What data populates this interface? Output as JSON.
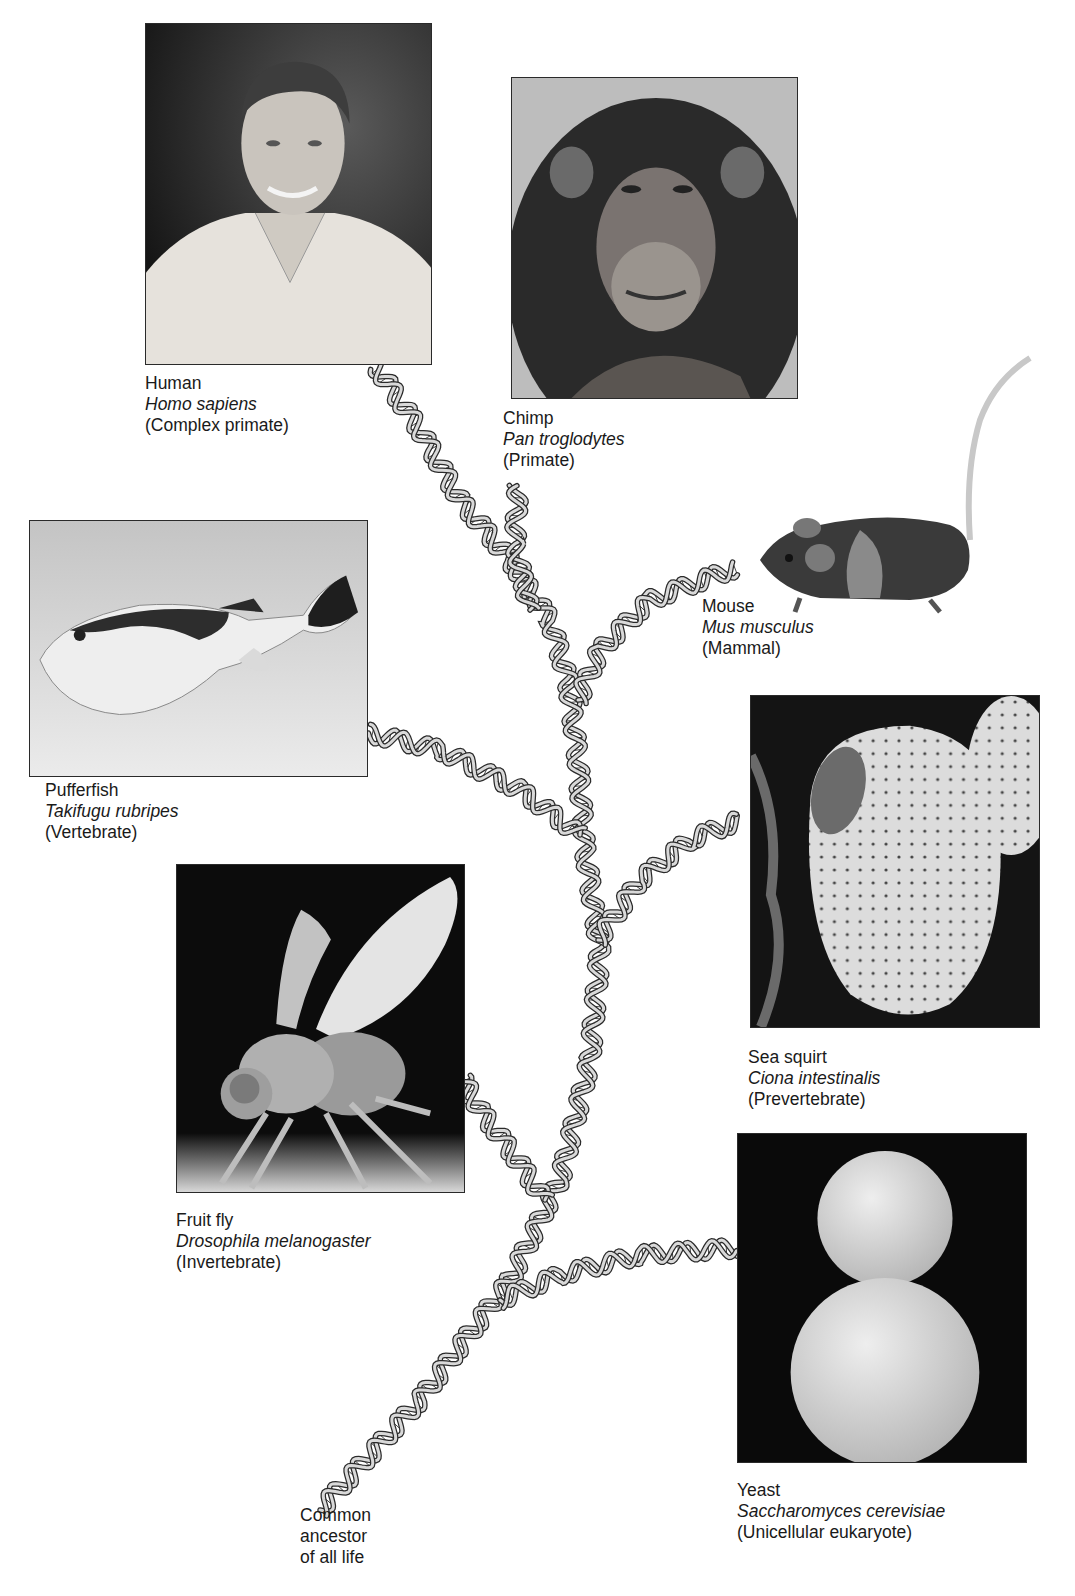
{
  "figure": {
    "root_label": [
      "Common",
      "ancestor",
      "of all life"
    ]
  },
  "organisms": [
    {
      "id": "human",
      "common": "Human",
      "scientific": "Homo sapiens",
      "class": "(Complex primate)",
      "photo": "photo-of-smiling-man-in-polo-shirt"
    },
    {
      "id": "chimp",
      "common": "Chimp",
      "scientific": "Pan troglodytes",
      "class": "(Primate)",
      "photo": "photo-of-chimpanzee-face"
    },
    {
      "id": "mouse",
      "common": "Mouse",
      "scientific": "Mus musculus",
      "class": "(Mammal)",
      "photo": "cutout-of-mouse"
    },
    {
      "id": "pufferfish",
      "common": "Pufferfish",
      "scientific": "Takifugu rubripes",
      "class": "(Vertebrate)",
      "photo": "photo-of-pufferfish"
    },
    {
      "id": "seasquirt",
      "common": "Sea squirt",
      "scientific": "Ciona intestinalis",
      "class": "(Prevertebrate)",
      "photo": "photo-of-sea-squirt"
    },
    {
      "id": "fruitfly",
      "common": "Fruit fly",
      "scientific": "Drosophila melanogaster",
      "class": "(Invertebrate)",
      "photo": "sem-photo-of-fruit-fly"
    },
    {
      "id": "yeast",
      "common": "Yeast",
      "scientific": "Saccharomyces cerevisiae",
      "class": "(Unicellular eukaryote)",
      "photo": "sem-photo-of-budding-yeast"
    }
  ],
  "colors": {
    "helix_fill": "#d9d9d9",
    "helix_stroke": "#2b2b2b",
    "frame": "#2a2a2a",
    "text": "#1a1a1a"
  }
}
